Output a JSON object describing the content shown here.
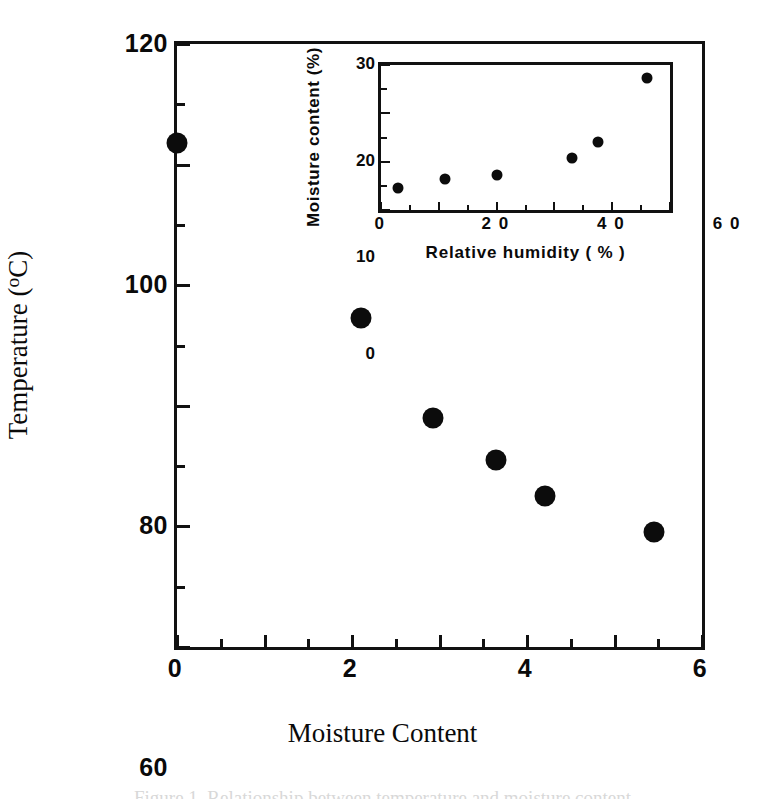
{
  "figure": {
    "caption_partial": "Figure  1.   Relationship  between  temperature  and  moisture  content"
  },
  "main": {
    "axis_title_y_text": "Temperature (",
    "axis_title_y_unit": "o",
    "axis_title_y_tail": "C)",
    "axis_title_y_full": "Temperature (oC)",
    "axis_title_x": "Moisture Content",
    "y_ticks": [
      "20",
      "40",
      "60",
      "80",
      "100",
      "120"
    ],
    "x_ticks": [
      "0",
      "2",
      "4",
      "6",
      "8",
      "1 0",
      "1 2"
    ]
  },
  "inset": {
    "axis_title_y": "Moisture  content  (%)",
    "axis_title_x": "Relative  humidity  (  %  )",
    "y_ticks": [
      "0",
      "10",
      "20",
      "30"
    ],
    "x_ticks": [
      "0",
      "2 0",
      "4 0",
      "6 0",
      "8 0",
      "1 0 0"
    ]
  },
  "colors": {
    "marker": "#0c0c0c",
    "axis": "#111111",
    "background": "#ffffff"
  },
  "chart_data": [
    {
      "type": "scatter",
      "name": "main",
      "title": "",
      "xlabel": "Moisture Content",
      "ylabel": "Temperature (oC)",
      "xlim": [
        0,
        12
      ],
      "ylim": [
        20,
        120
      ],
      "xticks": [
        0,
        2,
        4,
        6,
        8,
        10,
        12
      ],
      "yticks": [
        20,
        40,
        60,
        80,
        100,
        120
      ],
      "grid": false,
      "legend": "none",
      "series": [
        {
          "name": "Temperature vs moisture content",
          "points": [
            {
              "x": 0.0,
              "y": 103.5
            },
            {
              "x": 4.2,
              "y": 74.5
            },
            {
              "x": 5.85,
              "y": 58.0
            },
            {
              "x": 7.3,
              "y": 51.0
            },
            {
              "x": 8.4,
              "y": 45.0
            },
            {
              "x": 10.9,
              "y": 39.0
            }
          ]
        }
      ]
    },
    {
      "type": "scatter",
      "name": "inset",
      "title": "",
      "xlabel": "Relative humidity ( % )",
      "ylabel": "Moisture content (%)",
      "xlim": [
        0,
        100
      ],
      "ylim": [
        0,
        30
      ],
      "xticks": [
        0,
        20,
        40,
        60,
        80,
        100
      ],
      "yticks": [
        0,
        10,
        20,
        30
      ],
      "grid": false,
      "legend": "none",
      "series": [
        {
          "name": "Moisture content vs relative humidity",
          "points": [
            {
              "x": 6.0,
              "y": 4.5
            },
            {
              "x": 22.0,
              "y": 6.5
            },
            {
              "x": 40.0,
              "y": 7.2
            },
            {
              "x": 66.0,
              "y": 10.8
            },
            {
              "x": 75.0,
              "y": 14.0
            },
            {
              "x": 92.0,
              "y": 27.3
            }
          ]
        }
      ]
    }
  ]
}
